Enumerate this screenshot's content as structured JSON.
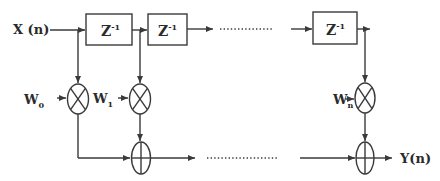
{
  "diagram": {
    "title": "",
    "type": "FIR transversal filter block diagram",
    "input_label": "X (n)",
    "output_label": "Y(n)",
    "delay_blocks": [
      {
        "label": "Z",
        "superscript": "-1"
      },
      {
        "label": "Z",
        "superscript": "-1"
      },
      {
        "label": "Z",
        "superscript": "-1"
      }
    ],
    "weights": [
      {
        "label": "W",
        "subscript": "0"
      },
      {
        "label": "W",
        "subscript": "1"
      },
      {
        "label": "W",
        "subscript": "n"
      }
    ],
    "multiplier_symbol": "⊗",
    "adder_symbol": "⊕",
    "ellipsis": "...............",
    "colors": {
      "line": "#3a3a3a",
      "text": "#2a2a2a",
      "background": "#ffffff"
    }
  }
}
